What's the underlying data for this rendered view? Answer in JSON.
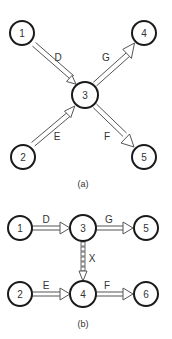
{
  "diagrams": {
    "a": {
      "caption": "(a)",
      "nodes": [
        {
          "id": "1",
          "label": "1"
        },
        {
          "id": "2",
          "label": "2"
        },
        {
          "id": "3",
          "label": "3"
        },
        {
          "id": "4",
          "label": "4"
        },
        {
          "id": "5",
          "label": "5"
        }
      ],
      "edges": [
        {
          "from": "1",
          "to": "3",
          "label": "D",
          "style": "solid"
        },
        {
          "from": "2",
          "to": "3",
          "label": "E",
          "style": "solid"
        },
        {
          "from": "3",
          "to": "4",
          "label": "G",
          "style": "solid"
        },
        {
          "from": "3",
          "to": "5",
          "label": "F",
          "style": "solid"
        }
      ]
    },
    "b": {
      "caption": "(b)",
      "nodes": [
        {
          "id": "1",
          "label": "1"
        },
        {
          "id": "2",
          "label": "2"
        },
        {
          "id": "3",
          "label": "3"
        },
        {
          "id": "4",
          "label": "4"
        },
        {
          "id": "5",
          "label": "5"
        },
        {
          "id": "6",
          "label": "6"
        }
      ],
      "edges": [
        {
          "from": "1",
          "to": "3",
          "label": "D",
          "style": "solid"
        },
        {
          "from": "3",
          "to": "5",
          "label": "G",
          "style": "solid"
        },
        {
          "from": "3",
          "to": "4",
          "label": "X",
          "style": "dummy-dashed"
        },
        {
          "from": "2",
          "to": "4",
          "label": "E",
          "style": "solid"
        },
        {
          "from": "4",
          "to": "6",
          "label": "F",
          "style": "solid"
        }
      ]
    }
  }
}
